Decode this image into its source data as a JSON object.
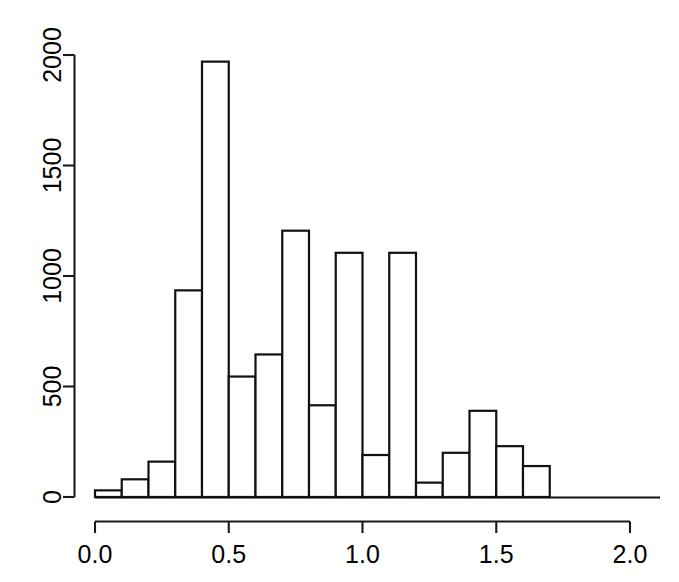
{
  "chart_data": {
    "type": "bar",
    "title": "",
    "subtitle": "",
    "xlabel": "",
    "ylabel": "",
    "grid": false,
    "legend": null,
    "xlim": [
      0.0,
      2.0
    ],
    "ylim": [
      0,
      2000
    ],
    "bin_width": 0.1,
    "x_ticks": [
      {
        "value": 0.0,
        "label": "0.0"
      },
      {
        "value": 0.5,
        "label": "0.5"
      },
      {
        "value": 1.0,
        "label": "1.0"
      },
      {
        "value": 1.5,
        "label": "1.5"
      },
      {
        "value": 2.0,
        "label": "2.0"
      }
    ],
    "y_ticks": [
      {
        "value": 0,
        "label": "0"
      },
      {
        "value": 500,
        "label": "500"
      },
      {
        "value": 1000,
        "label": "1000"
      },
      {
        "value": 1500,
        "label": "1500"
      },
      {
        "value": 2000,
        "label": "2000"
      }
    ],
    "bins": [
      {
        "x0": 0.0,
        "x1": 0.1,
        "count": 30
      },
      {
        "x0": 0.1,
        "x1": 0.2,
        "count": 80
      },
      {
        "x0": 0.2,
        "x1": 0.3,
        "count": 160
      },
      {
        "x0": 0.3,
        "x1": 0.4,
        "count": 935
      },
      {
        "x0": 0.4,
        "x1": 0.5,
        "count": 1970
      },
      {
        "x0": 0.5,
        "x1": 0.6,
        "count": 545
      },
      {
        "x0": 0.6,
        "x1": 0.7,
        "count": 645
      },
      {
        "x0": 0.7,
        "x1": 0.8,
        "count": 1205
      },
      {
        "x0": 0.8,
        "x1": 0.9,
        "count": 415
      },
      {
        "x0": 0.9,
        "x1": 1.0,
        "count": 1105
      },
      {
        "x0": 1.0,
        "x1": 1.1,
        "count": 190
      },
      {
        "x0": 1.1,
        "x1": 1.2,
        "count": 1105
      },
      {
        "x0": 1.2,
        "x1": 1.3,
        "count": 65
      },
      {
        "x0": 1.3,
        "x1": 1.4,
        "count": 200
      },
      {
        "x0": 1.4,
        "x1": 1.5,
        "count": 390
      },
      {
        "x0": 1.5,
        "x1": 1.6,
        "count": 230
      },
      {
        "x0": 1.6,
        "x1": 1.7,
        "count": 140
      },
      {
        "x0": 1.7,
        "x1": 1.8,
        "count": 0
      },
      {
        "x0": 1.8,
        "x1": 1.9,
        "count": 0
      },
      {
        "x0": 1.9,
        "x1": 2.0,
        "count": 0
      }
    ],
    "categories": [
      "0.0-0.1",
      "0.1-0.2",
      "0.2-0.3",
      "0.3-0.4",
      "0.4-0.5",
      "0.5-0.6",
      "0.6-0.7",
      "0.7-0.8",
      "0.8-0.9",
      "0.9-1.0",
      "1.0-1.1",
      "1.1-1.2",
      "1.2-1.3",
      "1.3-1.4",
      "1.4-1.5",
      "1.5-1.6",
      "1.6-1.7",
      "1.7-1.8",
      "1.8-1.9",
      "1.9-2.0"
    ],
    "values": [
      30,
      80,
      160,
      935,
      1970,
      545,
      645,
      1205,
      415,
      1105,
      190,
      1105,
      65,
      200,
      390,
      230,
      140,
      0,
      0,
      0
    ],
    "colors": {
      "bar_fill": "#ffffff",
      "bar_stroke": "#111111",
      "axis": "#1a1a1a",
      "background": "#ffffff",
      "text": "#000000"
    }
  },
  "geometry": {
    "plot_left_px": 95,
    "plot_right_px": 630,
    "baseline_y_px": 497,
    "top_y_px": 55,
    "y_axis_x_px": 74,
    "x_axis_y_px": 521
  }
}
